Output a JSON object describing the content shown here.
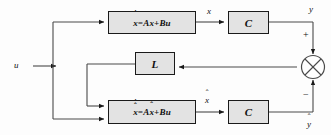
{
  "diagram": {
    "colors": {
      "block_fill": "#e3e3e3",
      "line": "#1a1a1a",
      "background": "#fdfdfd"
    },
    "blocks": {
      "plant": {
        "label": "ẋ=Ax+Bu",
        "lhs_var": "x",
        "lhs_mark": "dot",
        "rhs": "=Ax+Bu"
      },
      "observer": {
        "label": "x̂̇=Ax̂+Bu",
        "lhs_var": "x",
        "lhs_mark": "dot-hat",
        "rhs_pre": "=A",
        "rhs_var": "x",
        "rhs_post": "+Bu"
      },
      "output_gain_top": {
        "label": "C"
      },
      "output_gain_bottom": {
        "label": "C"
      },
      "observer_gain": {
        "label": "L"
      }
    },
    "signals": {
      "input": "u",
      "state": "x",
      "state_estimate": "x̂",
      "output": "y",
      "output_estimate": "ŷ",
      "sum_plus": "+",
      "sum_minus": "−"
    },
    "summing_junction": {
      "name": "summing-junction",
      "style": "circle-with-x",
      "inputs": [
        "y",
        "ŷ"
      ]
    }
  }
}
